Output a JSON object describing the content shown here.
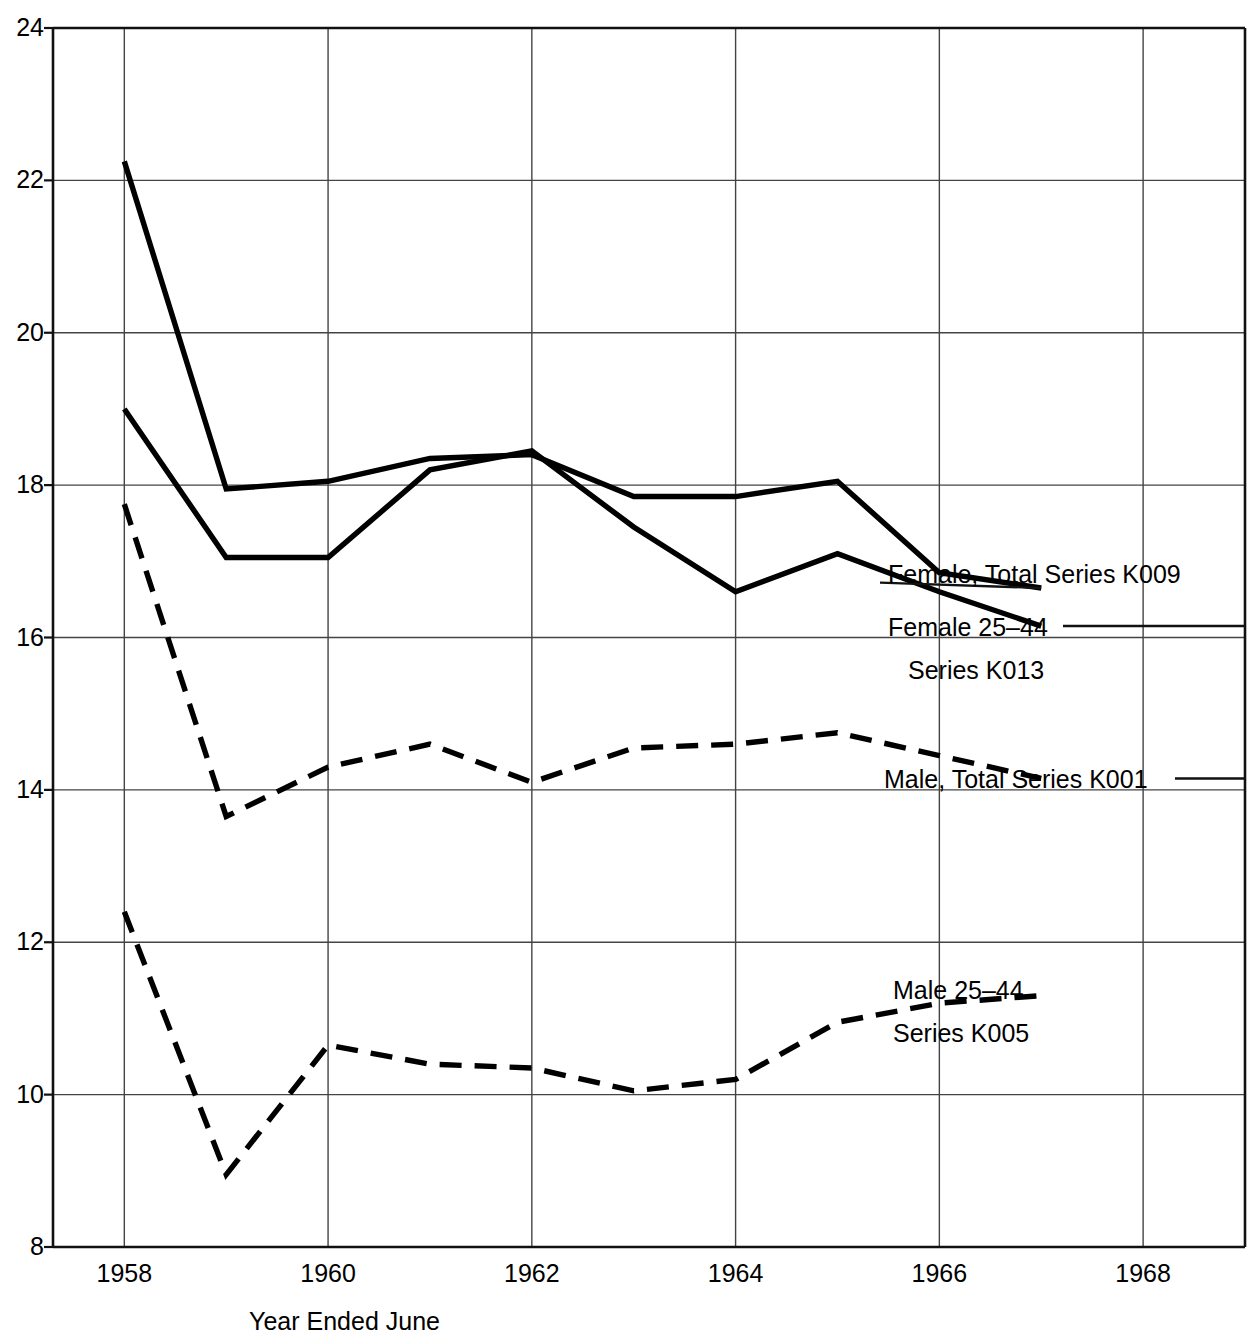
{
  "chart_data": {
    "type": "line",
    "title": "",
    "xlabel": "Year Ended June",
    "ylabel": "",
    "xlim": [
      1957.3,
      1969.0
    ],
    "ylim": [
      8,
      24
    ],
    "xticks": [
      "1958",
      "1960",
      "1962",
      "1964",
      "1966",
      "1968"
    ],
    "xtick_values": [
      1958,
      1960,
      1962,
      1964,
      1966,
      1968
    ],
    "yticks": [
      "8",
      "10",
      "12",
      "14",
      "16",
      "18",
      "20",
      "22",
      "24"
    ],
    "ytick_values": [
      8,
      10,
      12,
      14,
      16,
      18,
      20,
      22,
      24
    ],
    "grid": true,
    "legend_position": "inline-right-annotations",
    "x": [
      1958,
      1959,
      1960,
      1961,
      1962,
      1963,
      1964,
      1965,
      1966,
      1967
    ],
    "series": [
      {
        "name": "Female, Total Series K009",
        "label_lines": [
          "Female, Total Series K009"
        ],
        "style": "solid",
        "color": "#000000",
        "values": [
          22.25,
          17.95,
          18.05,
          18.35,
          18.4,
          17.85,
          17.85,
          18.05,
          16.85,
          16.65
        ]
      },
      {
        "name": "Female 25-44 Series K013",
        "label_lines": [
          "Female 25–44",
          "Series K013"
        ],
        "style": "solid",
        "color": "#000000",
        "values": [
          19.0,
          17.05,
          17.05,
          18.2,
          18.45,
          17.45,
          16.6,
          17.1,
          16.6,
          16.15
        ]
      },
      {
        "name": "Male, Total Series K001",
        "label_lines": [
          "Male, Total Series K001"
        ],
        "style": "dashed",
        "color": "#000000",
        "values": [
          17.75,
          13.65,
          14.3,
          14.6,
          14.1,
          14.55,
          14.6,
          14.75,
          14.45,
          14.15
        ]
      },
      {
        "name": "Male 25-44 Series K005",
        "label_lines": [
          "Male 25–44",
          "Series K005"
        ],
        "style": "dashed",
        "color": "#000000",
        "values": [
          12.4,
          8.95,
          10.65,
          10.4,
          10.35,
          10.05,
          10.2,
          10.95,
          11.2,
          11.3
        ]
      }
    ],
    "annotations": [
      {
        "text": "Female, Total Series K009",
        "x": 1967.05,
        "y": 16.85,
        "leader": false
      },
      {
        "text": "Female 25–44",
        "x": 1967.05,
        "y": 16.15,
        "leader": true
      },
      {
        "text": "Series K013",
        "x": 1967.25,
        "y": 15.6,
        "leader": false
      },
      {
        "text": "Male, Total Series K001",
        "x": 1967.05,
        "y": 14.15,
        "leader": true
      },
      {
        "text": "Male 25–44",
        "x": 1967.05,
        "y": 11.35,
        "leader": false
      },
      {
        "text": "Series K005",
        "x": 1967.05,
        "y": 10.8,
        "leader": false
      }
    ]
  },
  "axis": {
    "x_title": "Year Ended June"
  },
  "annotations": {
    "female_total": "Female, Total Series K009",
    "female_2544_line1": "Female 25–44",
    "female_2544_line2": "Series K013",
    "male_total": "Male, Total Series K001",
    "male_2544_line1": "Male 25–44",
    "male_2544_line2": "Series K005"
  },
  "ytick_labels": [
    "24",
    "22",
    "20",
    "18",
    "16",
    "14",
    "12",
    "10",
    "8"
  ],
  "xtick_labels": [
    "1958",
    "1960",
    "1962",
    "1964",
    "1966",
    "1968"
  ]
}
